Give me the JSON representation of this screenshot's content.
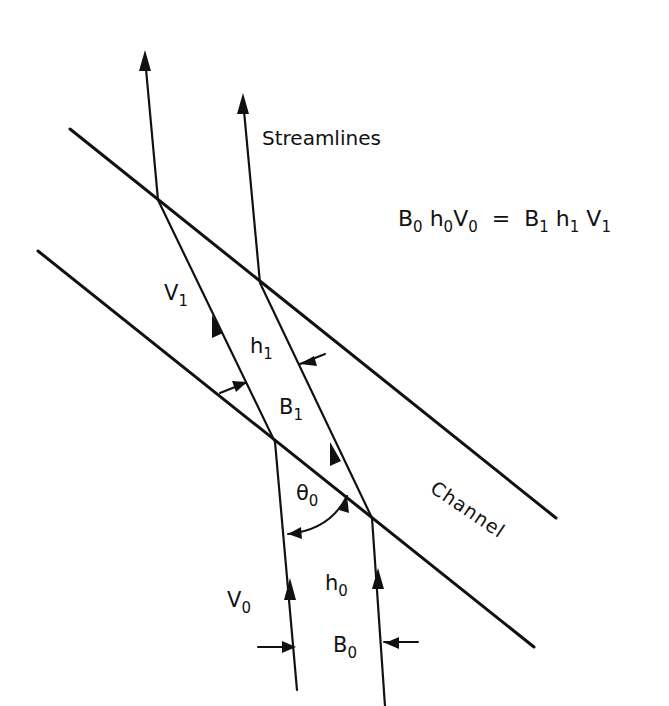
{
  "labels": {
    "streamlines": "Streamlines",
    "channel": "Channel",
    "equation": {
      "B0": "B",
      "B0_sub": "0",
      "h0": "h",
      "h0_sub": "0",
      "V0": "V",
      "V0_sub": "0",
      "equals": "=",
      "B1": "B",
      "B1_sub": "1",
      "h1": "h",
      "h1_sub": "1",
      "V1": "V",
      "V1_sub": "1"
    },
    "V1": {
      "base": "V",
      "sub": "1"
    },
    "h1": {
      "base": "h",
      "sub": "1"
    },
    "B1": {
      "base": "B",
      "sub": "1"
    },
    "theta0": {
      "base": "θ",
      "sub": "0"
    },
    "V0": {
      "base": "V",
      "sub": "0"
    },
    "h0": {
      "base": "h",
      "sub": "0"
    },
    "B0": {
      "base": "B",
      "sub": "0"
    }
  },
  "colors": {
    "ink": "#111111",
    "background": "#ffffff"
  }
}
